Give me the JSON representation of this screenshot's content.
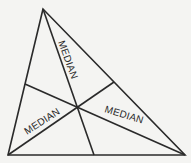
{
  "diagram": {
    "type": "triangle-medians",
    "vertices": {
      "A": [
        43,
        9
      ],
      "B": [
        8,
        155
      ],
      "C": [
        185,
        155
      ]
    },
    "midpoints": {
      "BC": [
        94,
        155
      ],
      "AC": [
        114,
        82
      ],
      "AB": [
        25,
        84
      ]
    },
    "centroid": [
      78,
      107
    ],
    "labels": [
      {
        "text": "MEDIAN",
        "x": 69,
        "y": 46,
        "rotate": 70
      },
      {
        "text": "MEDIAN",
        "x": 40,
        "y": 125,
        "rotate": -33
      },
      {
        "text": "MEDIAN",
        "x": 120,
        "y": 121,
        "rotate": 17
      }
    ],
    "stroke_color": "#2a2a2a"
  }
}
